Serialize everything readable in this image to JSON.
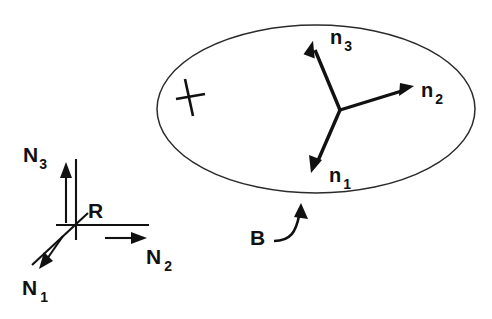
{
  "figure": {
    "background_color": "#ffffff",
    "ink_color": "#111111",
    "ellipse_stroke_color": "#2b2b2b",
    "width": 492,
    "height": 319
  },
  "body": {
    "name": "ellipse-body-B",
    "label": "B",
    "label_x": 250,
    "label_y": 245,
    "center_x": 316,
    "center_y": 109,
    "radius_x": 159,
    "radius_y": 84,
    "pointer_target_x": 318,
    "pointer_target_y": 194
  },
  "mark": {
    "name": "material-point-cross",
    "center_x": 190,
    "center_y": 97,
    "glyph": "cross-mark"
  },
  "body_frame": {
    "name": "body-fixed-basis",
    "origin_x": 340,
    "origin_y": 110,
    "vectors": [
      {
        "id": "n3",
        "label": "n",
        "subscript": "3",
        "tip_x": 312,
        "tip_y": 44,
        "label_x": 330,
        "label_y": 44,
        "direction": "up-left"
      },
      {
        "id": "n2",
        "label": "n",
        "subscript": "2",
        "tip_x": 412,
        "tip_y": 86,
        "label_x": 421,
        "label_y": 97,
        "direction": "up-right"
      },
      {
        "id": "n1",
        "label": "n",
        "subscript": "1",
        "tip_x": 312,
        "tip_y": 171,
        "label_x": 329,
        "label_y": 182,
        "direction": "down-left"
      }
    ]
  },
  "reference_frame": {
    "name": "reference-frame-R",
    "label": "R",
    "label_x": 88,
    "label_y": 218,
    "origin_x": 76,
    "origin_y": 225,
    "axes": [
      {
        "id": "N3",
        "label": "N",
        "subscript": "3",
        "axis_tip_x": 76,
        "axis_tip_y": 159,
        "arrow_x": 66,
        "arrow_from_y": 223,
        "arrow_to_y": 167,
        "label_x": 23,
        "label_y": 162,
        "direction": "up"
      },
      {
        "id": "N2",
        "label": "N",
        "subscript": "2",
        "axis_tip_x": 149,
        "axis_tip_y": 225,
        "arrow_y": 238,
        "arrow_from_x": 105,
        "arrow_to_x": 143,
        "label_x": 146,
        "label_y": 264,
        "direction": "right"
      },
      {
        "id": "N1",
        "label": "N",
        "subscript": "1",
        "axis_tip_x": 32,
        "axis_tip_y": 265,
        "arrow_from_x": 58,
        "arrow_from_y": 240,
        "arrow_to_x": 41,
        "arrow_to_y": 268,
        "label_x": 22,
        "label_y": 295,
        "direction": "down-left"
      }
    ]
  }
}
